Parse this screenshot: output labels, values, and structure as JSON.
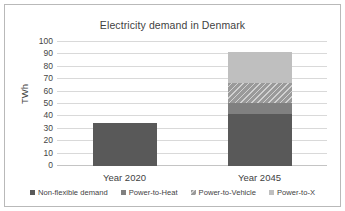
{
  "chart_data": {
    "type": "bar",
    "title": "Electricity demand in Denmark",
    "xlabel": "",
    "ylabel": "TWh",
    "ylim": [
      0,
      100
    ],
    "yticks": [
      100,
      90,
      80,
      70,
      60,
      50,
      40,
      30,
      20,
      10,
      0
    ],
    "grid": true,
    "stacked": true,
    "legend_position": "bottom",
    "categories": [
      "Year 2020",
      "Year 2045"
    ],
    "series": [
      {
        "name": "Non-flexible demand",
        "values": [
          35,
          42
        ],
        "color": "#595959"
      },
      {
        "name": "Power-to-Heat",
        "values": [
          0,
          9
        ],
        "color": "#808080"
      },
      {
        "name": "Power-to-Vehicle",
        "values": [
          0,
          16
        ],
        "color": "#9a9a9a"
      },
      {
        "name": "Power-to-X",
        "values": [
          0,
          25
        ],
        "color": "#bfbfbf"
      }
    ],
    "totals": [
      35,
      92
    ]
  },
  "legend": {
    "items": [
      {
        "label": "Non-flexible demand"
      },
      {
        "label": "Power-to-Heat"
      },
      {
        "label": "Power-to-Vehicle"
      },
      {
        "label": "Power-to-X"
      }
    ]
  }
}
